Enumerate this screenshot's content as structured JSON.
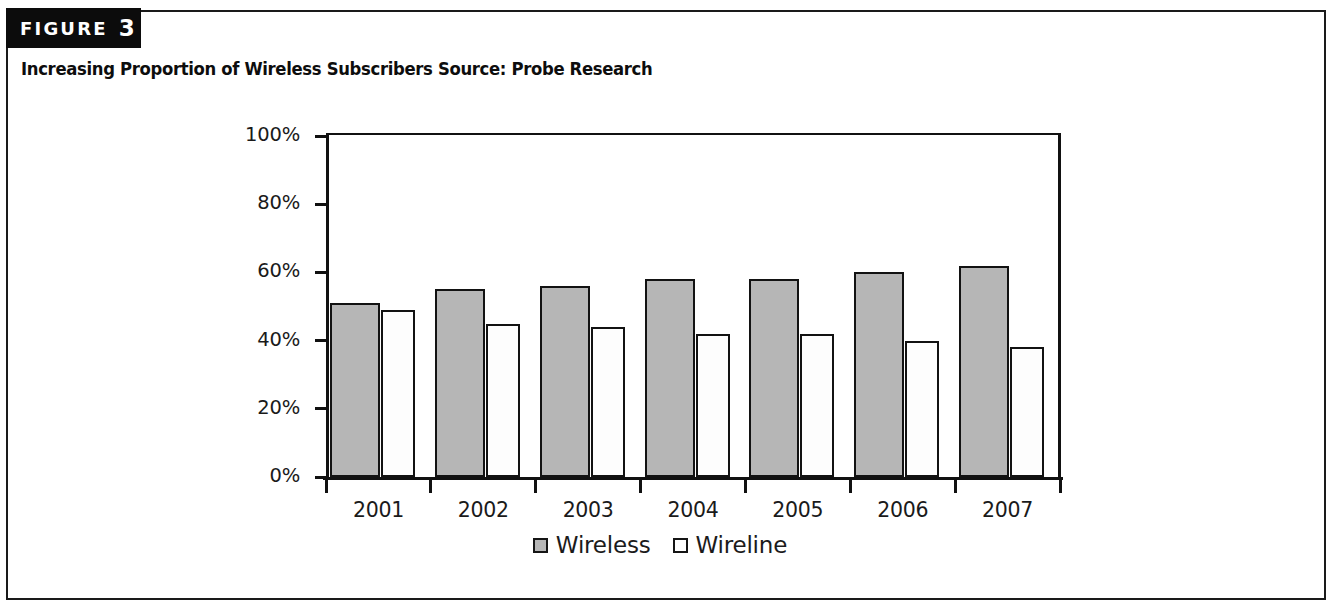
{
  "figure": {
    "badge_word": "FIGURE",
    "badge_number": "3",
    "caption": "Increasing Proportion of Wireless Subscribers Source: Probe Research"
  },
  "legend": {
    "position": "bottom-center",
    "items": [
      {
        "label": "Wireless",
        "swatch": "wireless-swatch",
        "color": "#b6b6b6"
      },
      {
        "label": "Wireline",
        "swatch": "wireline-swatch",
        "color": "#ffffff"
      }
    ]
  },
  "axes": {
    "y_ticks": [
      "100%",
      "80%",
      "60%",
      "40%",
      "20%",
      "0%"
    ],
    "y_tick_values": [
      100,
      80,
      60,
      40,
      20,
      0
    ],
    "x_ticks": [
      "2001",
      "2002",
      "2003",
      "2004",
      "2005",
      "2006",
      "2007"
    ]
  },
  "chart_data": {
    "type": "bar",
    "title": "Increasing Proportion of Wireless Subscribers Source: Probe Research",
    "xlabel": "",
    "ylabel": "",
    "ylim": [
      0,
      100
    ],
    "yticks": [
      0,
      20,
      40,
      60,
      80,
      100
    ],
    "ytick_labels": [
      "0%",
      "20%",
      "40%",
      "60%",
      "80%",
      "100%"
    ],
    "grid": false,
    "legend_position": "bottom-center",
    "categories": [
      "2001",
      "2002",
      "2003",
      "2004",
      "2005",
      "2006",
      "2007"
    ],
    "series": [
      {
        "name": "Wireless",
        "color": "#b6b6b6",
        "values": [
          51,
          55,
          56,
          58,
          58,
          60,
          62
        ]
      },
      {
        "name": "Wireline",
        "color": "#ffffff",
        "values": [
          49,
          45,
          44,
          42,
          42,
          40,
          38
        ]
      }
    ]
  }
}
